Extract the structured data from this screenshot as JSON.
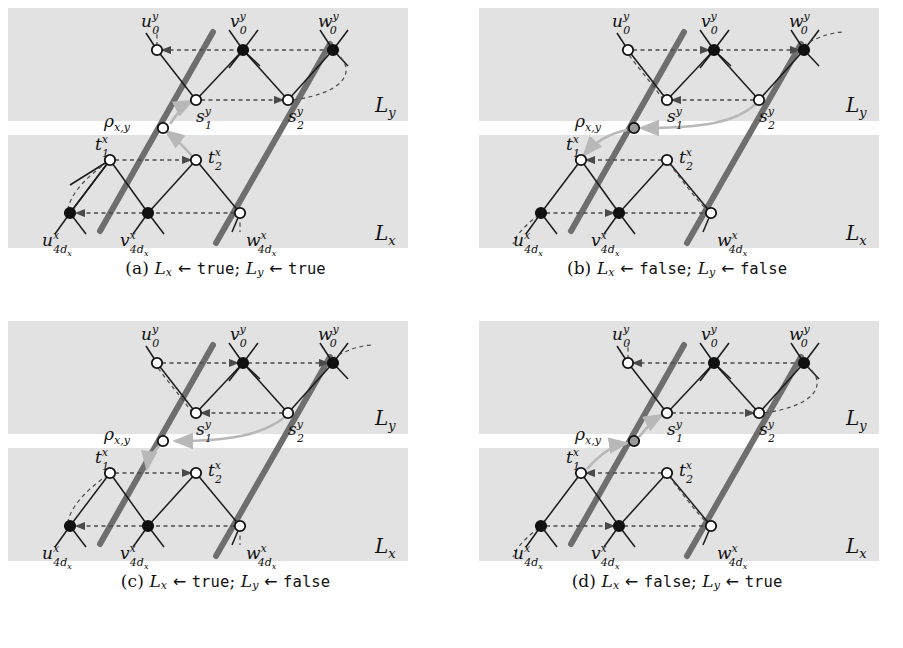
{
  "figure": {
    "kind": "four-panel-diagram",
    "panels": [
      {
        "id": "a",
        "caption_prefix": "(a)",
        "caption_lx_var": "L",
        "caption_lx_sub": "x",
        "caption_arrow": "←",
        "caption_lx_value": "true",
        "caption_sep": ";",
        "caption_ly_var": "L",
        "caption_ly_sub": "y",
        "caption_ly_value": "true",
        "band_label_top": "L",
        "band_label_top_sub": "y",
        "band_label_bottom": "L",
        "band_label_bottom_sub": "x",
        "nodes": {
          "u0y": {
            "label": "u",
            "sup": "y",
            "sub": "0",
            "fill": "open"
          },
          "v0y": {
            "label": "v",
            "sup": "y",
            "sub": "0",
            "fill": "solid"
          },
          "w0y": {
            "label": "w",
            "sup": "y",
            "sub": "0",
            "fill": "solid"
          },
          "s1y": {
            "label": "s",
            "sup": "y",
            "sub": "1",
            "fill": "open"
          },
          "s2y": {
            "label": "s",
            "sup": "y",
            "sub": "2",
            "fill": "open"
          },
          "rho": {
            "label": "ρ",
            "sub": "x,y",
            "fill": "open"
          },
          "t1x": {
            "label": "t",
            "sup": "x",
            "sub": "1",
            "fill": "open"
          },
          "t2x": {
            "label": "t",
            "sup": "x",
            "sub": "2",
            "fill": "open"
          },
          "u4x": {
            "label": "u",
            "sup": "x",
            "sub": "4d",
            "subsub": "x",
            "fill": "solid"
          },
          "v4x": {
            "label": "v",
            "sup": "x",
            "sub": "4d",
            "subsub": "x",
            "fill": "solid"
          },
          "w4x": {
            "label": "w",
            "sup": "x",
            "sub": "4d",
            "subsub": "x",
            "fill": "open"
          }
        },
        "arrows_top": [
          {
            "from": "v0y",
            "to": "u0y",
            "dir": "left"
          },
          {
            "from": "w0y",
            "to": "v0y",
            "dir": "left"
          },
          {
            "from": "s1y",
            "to": "s2y",
            "dir": "right"
          }
        ],
        "arrows_bottom": [
          {
            "from": "t1x",
            "to": "t2x",
            "dir": "right"
          },
          {
            "from": "v4x",
            "to": "u4x",
            "dir": "left"
          },
          {
            "from": "w4x",
            "to": "v4x",
            "dir": "left"
          }
        ],
        "rho_path": "t2x -> rho -> s1y",
        "thick_segments": [
          "u0y-upper",
          "s2y-w0y",
          "t1x-lower",
          "w4x-lower"
        ],
        "thick_full_diagonals": [
          "left-diagonal",
          "right-diagonal"
        ]
      },
      {
        "id": "b",
        "caption_prefix": "(b)",
        "caption_lx_var": "L",
        "caption_lx_sub": "x",
        "caption_arrow": "←",
        "caption_lx_value": "false",
        "caption_sep": ";",
        "caption_ly_var": "L",
        "caption_ly_sub": "y",
        "caption_ly_value": "false",
        "band_label_top": "L",
        "band_label_top_sub": "y",
        "band_label_bottom": "L",
        "band_label_bottom_sub": "x",
        "nodes": {
          "u0y": {
            "label": "u",
            "sup": "y",
            "sub": "0",
            "fill": "open"
          },
          "v0y": {
            "label": "v",
            "sup": "y",
            "sub": "0",
            "fill": "solid"
          },
          "w0y": {
            "label": "w",
            "sup": "y",
            "sub": "0",
            "fill": "solid"
          },
          "s1y": {
            "label": "s",
            "sup": "y",
            "sub": "1",
            "fill": "open"
          },
          "s2y": {
            "label": "s",
            "sup": "y",
            "sub": "2",
            "fill": "open"
          },
          "rho": {
            "label": "ρ",
            "sub": "x,y",
            "fill": "gray"
          },
          "t1x": {
            "label": "t",
            "sup": "x",
            "sub": "1",
            "fill": "open"
          },
          "t2x": {
            "label": "t",
            "sup": "x",
            "sub": "2",
            "fill": "open"
          },
          "u4x": {
            "label": "u",
            "sup": "x",
            "sub": "4d",
            "subsub": "x",
            "fill": "solid"
          },
          "v4x": {
            "label": "v",
            "sup": "x",
            "sub": "4d",
            "subsub": "x",
            "fill": "solid"
          },
          "w4x": {
            "label": "w",
            "sup": "x",
            "sub": "4d",
            "subsub": "x",
            "fill": "open"
          }
        },
        "arrows_top": [
          {
            "from": "u0y",
            "to": "v0y",
            "dir": "right"
          },
          {
            "from": "v0y",
            "to": "w0y",
            "dir": "right"
          },
          {
            "from": "s2y",
            "to": "s1y",
            "dir": "left"
          }
        ],
        "arrows_bottom": [
          {
            "from": "t2x",
            "to": "t1x",
            "dir": "left"
          },
          {
            "from": "u4x",
            "to": "v4x",
            "dir": "right"
          },
          {
            "from": "v4x",
            "to": "w4x",
            "dir": "right"
          }
        ],
        "rho_path": "s2y -> rho -> t1x",
        "thick_segments": [
          "u0y-upper",
          "s2y-w0y",
          "t1x-lower",
          "w4x-lower"
        ],
        "thick_full_diagonals": [
          "left-diagonal",
          "right-diagonal"
        ]
      },
      {
        "id": "c",
        "caption_prefix": "(c)",
        "caption_lx_var": "L",
        "caption_lx_sub": "x",
        "caption_arrow": "←",
        "caption_lx_value": "true",
        "caption_sep": ";",
        "caption_ly_var": "L",
        "caption_ly_sub": "y",
        "caption_ly_value": "false",
        "band_label_top": "L",
        "band_label_top_sub": "y",
        "band_label_bottom": "L",
        "band_label_bottom_sub": "x",
        "nodes": {
          "u0y": {
            "label": "u",
            "sup": "y",
            "sub": "0",
            "fill": "open"
          },
          "v0y": {
            "label": "v",
            "sup": "y",
            "sub": "0",
            "fill": "solid"
          },
          "w0y": {
            "label": "w",
            "sup": "y",
            "sub": "0",
            "fill": "solid"
          },
          "s1y": {
            "label": "s",
            "sup": "y",
            "sub": "1",
            "fill": "open"
          },
          "s2y": {
            "label": "s",
            "sup": "y",
            "sub": "2",
            "fill": "open"
          },
          "rho": {
            "label": "ρ",
            "sub": "x,y",
            "fill": "open"
          },
          "t1x": {
            "label": "t",
            "sup": "x",
            "sub": "1",
            "fill": "open"
          },
          "t2x": {
            "label": "t",
            "sup": "x",
            "sub": "2",
            "fill": "open"
          },
          "u4x": {
            "label": "u",
            "sup": "x",
            "sub": "4d",
            "subsub": "x",
            "fill": "solid"
          },
          "v4x": {
            "label": "v",
            "sup": "x",
            "sub": "4d",
            "subsub": "x",
            "fill": "solid"
          },
          "w4x": {
            "label": "w",
            "sup": "x",
            "sub": "4d",
            "subsub": "x",
            "fill": "open"
          }
        },
        "arrows_top": [
          {
            "from": "u0y",
            "to": "v0y",
            "dir": "right"
          },
          {
            "from": "v0y",
            "to": "w0y",
            "dir": "right"
          },
          {
            "from": "s2y",
            "to": "s1y",
            "dir": "left"
          }
        ],
        "arrows_bottom": [
          {
            "from": "t1x",
            "to": "t2x",
            "dir": "right"
          },
          {
            "from": "v4x",
            "to": "u4x",
            "dir": "left"
          },
          {
            "from": "w4x",
            "to": "v4x",
            "dir": "left"
          }
        ],
        "rho_path": "s2y -> rho -> t2x",
        "thick_segments": [
          "u0y-upper",
          "s2y-w0y",
          "t1x-lower",
          "w4x-lower"
        ],
        "thick_full_diagonals": [
          "left-diagonal",
          "right-diagonal"
        ]
      },
      {
        "id": "d",
        "caption_prefix": "(d)",
        "caption_lx_var": "L",
        "caption_lx_sub": "x",
        "caption_arrow": "←",
        "caption_lx_value": "false",
        "caption_sep": ";",
        "caption_ly_var": "L",
        "caption_ly_sub": "y",
        "caption_ly_value": "true",
        "band_label_top": "L",
        "band_label_top_sub": "y",
        "band_label_bottom": "L",
        "band_label_bottom_sub": "x",
        "nodes": {
          "u0y": {
            "label": "u",
            "sup": "y",
            "sub": "0",
            "fill": "open"
          },
          "v0y": {
            "label": "v",
            "sup": "y",
            "sub": "0",
            "fill": "solid"
          },
          "w0y": {
            "label": "w",
            "sup": "y",
            "sub": "0",
            "fill": "solid"
          },
          "s1y": {
            "label": "s",
            "sup": "y",
            "sub": "1",
            "fill": "open"
          },
          "s2y": {
            "label": "s",
            "sup": "y",
            "sub": "2",
            "fill": "open"
          },
          "rho": {
            "label": "ρ",
            "sub": "x,y",
            "fill": "gray"
          },
          "t1x": {
            "label": "t",
            "sup": "x",
            "sub": "1",
            "fill": "open"
          },
          "t2x": {
            "label": "t",
            "sup": "x",
            "sub": "2",
            "fill": "open"
          },
          "u4x": {
            "label": "u",
            "sup": "x",
            "sub": "4d",
            "subsub": "x",
            "fill": "solid"
          },
          "v4x": {
            "label": "v",
            "sup": "x",
            "sub": "4d",
            "subsub": "x",
            "fill": "solid"
          },
          "w4x": {
            "label": "w",
            "sup": "x",
            "sub": "4d",
            "subsub": "x",
            "fill": "open"
          }
        },
        "arrows_top": [
          {
            "from": "v0y",
            "to": "u0y",
            "dir": "left"
          },
          {
            "from": "w0y",
            "to": "v0y",
            "dir": "left"
          },
          {
            "from": "s1y",
            "to": "s2y",
            "dir": "right"
          }
        ],
        "arrows_bottom": [
          {
            "from": "t2x",
            "to": "t1x",
            "dir": "left"
          },
          {
            "from": "u4x",
            "to": "v4x",
            "dir": "right"
          },
          {
            "from": "v4x",
            "to": "w4x",
            "dir": "right"
          }
        ],
        "rho_path": "t1x -> rho -> s1y",
        "thick_segments": [
          "u0y-upper",
          "s2y-w0y",
          "t1x-lower",
          "w4x-lower"
        ],
        "thick_full_diagonals": [
          "left-diagonal",
          "right-diagonal"
        ]
      }
    ],
    "colors": {
      "band": "#e2e2e2",
      "page": "#ffffff",
      "thick_line": "#6e6e6e",
      "thin_line": "#1a1a1a",
      "dashed_arrow": "#4a4a4a",
      "rho_arrow": "#b8b8b8",
      "node_solid": "#111111",
      "node_open_fill": "#ffffff",
      "node_gray_fill": "#9a9a9a",
      "text": "#111111"
    }
  }
}
